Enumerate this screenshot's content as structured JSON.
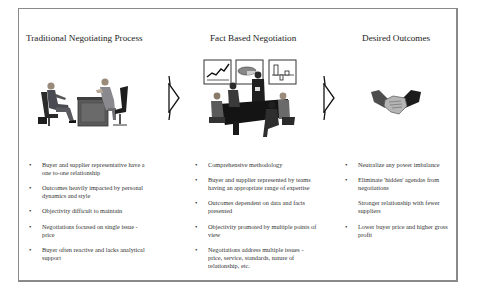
{
  "columns": [
    {
      "heading": "Traditional Negotiating Process",
      "illustration": "two-person-meeting-clipart",
      "items": [
        {
          "text": "Buyer and supplier representative have a one to-one relationship",
          "bullet": true
        },
        {
          "text": "Outcomes heavily impacted by personal dynamics and style",
          "bullet": true
        },
        {
          "text": "Objectivity difficult to maintain",
          "bullet": true
        },
        {
          "text": "Negotiations focused on single issue - price",
          "bullet": true
        },
        {
          "text": "Buyer often reactive and lacks analytical support",
          "bullet": true
        }
      ]
    },
    {
      "heading": "Fact Based Negotiation",
      "illustration": "team-meeting-with-charts-clipart",
      "items": [
        {
          "text": "Comprehensive methodology",
          "bullet": true
        },
        {
          "text": "Buyer and supplier represented by teams having an appropriate range of expertise",
          "bullet": true
        },
        {
          "text": "Outcomes dependent on data and facts presented",
          "bullet": true
        },
        {
          "text": "Objectivity promoted by multiple points of view",
          "bullet": true
        },
        {
          "text": "Negotiations address multiple issues - price, service, standards, nature of relationship, etc.",
          "bullet": true
        }
      ]
    },
    {
      "heading": "Desired Outcomes",
      "illustration": "handshake-clipart",
      "items": [
        {
          "text": "Neutralize any power imbalance",
          "bullet": true
        },
        {
          "text": "Eliminate 'hidden' agendas from negotiations",
          "bullet": true
        },
        {
          "text": "Stronger relationship with fewer suppliers",
          "bullet": false
        },
        {
          "text": "Lower buyer price and higher gross profit",
          "bullet": true
        }
      ]
    }
  ],
  "bullet_glyph": "•",
  "connectors": [
    {
      "from": "Traditional Negotiating Process",
      "to": "Fact Based Negotiation",
      "icon": "chevron-arrow-right"
    },
    {
      "from": "Fact Based Negotiation",
      "to": "Desired Outcomes",
      "icon": "chevron-arrow-right"
    }
  ]
}
